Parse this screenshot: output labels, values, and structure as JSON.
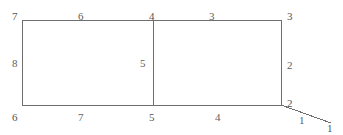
{
  "diagram": {
    "type": "line-figure",
    "title": "",
    "background_color": "#ffffff",
    "stroke_color": "#6e6e6e",
    "stroke_width": 1,
    "label_color": "#5a5a5a",
    "width": 343,
    "height": 135,
    "vertex_labels": [
      {
        "id": "vertex-7",
        "text": "7",
        "x": 12,
        "y": 11
      },
      {
        "id": "vertex-4",
        "text": "4",
        "x": 149,
        "y": 11
      },
      {
        "id": "vertex-3",
        "text": "3",
        "x": 287,
        "y": 11
      },
      {
        "id": "vertex-6",
        "text": "6",
        "x": 12,
        "y": 112
      },
      {
        "id": "vertex-5",
        "text": "5",
        "x": 149,
        "y": 112
      },
      {
        "id": "vertex-2",
        "text": "2",
        "x": 287,
        "y": 98
      },
      {
        "id": "vertex-1",
        "text": "1",
        "x": 327,
        "y": 123
      }
    ],
    "edge_labels": [
      {
        "id": "edge-6",
        "text": "6",
        "x": 78,
        "y": 11
      },
      {
        "id": "edge-3",
        "text": "3",
        "x": 209,
        "y": 11
      },
      {
        "id": "edge-8",
        "text": "8",
        "x": 12,
        "y": 58
      },
      {
        "id": "edge-5",
        "text": "5",
        "x": 140,
        "y": 58
      },
      {
        "id": "edge-2",
        "text": "2",
        "x": 287,
        "y": 60
      },
      {
        "id": "edge-7",
        "text": "7",
        "x": 78,
        "y": 112
      },
      {
        "id": "edge-4",
        "text": "4",
        "x": 215,
        "y": 112
      },
      {
        "id": "edge-1",
        "text": "1",
        "x": 299,
        "y": 115
      }
    ],
    "segments": [
      {
        "id": "top-left-edge",
        "x1": 22,
        "y1": 20,
        "x2": 153,
        "y2": 20
      },
      {
        "id": "top-right-edge",
        "x1": 153,
        "y1": 20,
        "x2": 281,
        "y2": 20
      },
      {
        "id": "left-edge",
        "x1": 22,
        "y1": 20,
        "x2": 22,
        "y2": 105
      },
      {
        "id": "middle-divider",
        "x1": 153,
        "y1": 20,
        "x2": 153,
        "y2": 105
      },
      {
        "id": "right-edge",
        "x1": 281,
        "y1": 20,
        "x2": 281,
        "y2": 105
      },
      {
        "id": "bottom-left-edge",
        "x1": 22,
        "y1": 105,
        "x2": 153,
        "y2": 105
      },
      {
        "id": "bottom-right-edge",
        "x1": 153,
        "y1": 105,
        "x2": 281,
        "y2": 105
      },
      {
        "id": "diagonal-tail",
        "x1": 281,
        "y1": 105,
        "x2": 331,
        "y2": 123
      }
    ]
  }
}
